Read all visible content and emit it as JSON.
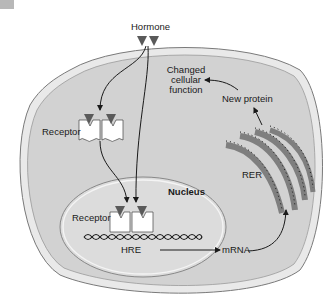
{
  "diagram": {
    "type": "cell-signaling",
    "labels": {
      "hormone": "Hormone",
      "receptor_cytoplasm": "Receptor",
      "receptor_nucleus": "Receptor",
      "nucleus": "Nucleus",
      "hre": "HRE",
      "mrna": "mRNA",
      "rer": "RER",
      "new_protein": "New protein",
      "changed_function_line1": "Changed",
      "changed_function_line2": "cellular",
      "changed_function_line3": "function"
    },
    "colors": {
      "cell_fill": "#d4d4d4",
      "membrane": "#bdbdbd",
      "hormone": "#5a5a5a",
      "rer": "#8e8e8e",
      "receptor": "#ffffff",
      "line": "#1a1a1a"
    }
  }
}
